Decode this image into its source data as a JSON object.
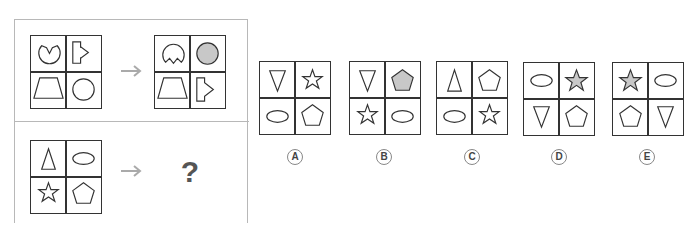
{
  "puzzle": {
    "example": {
      "before": [
        "pacman-open-top",
        "arrow-pentagon-right",
        "trapezoid",
        "circle"
      ],
      "after": [
        "pacman-open-bottom",
        "circle-filled",
        "trapezoid",
        "arrow-pentagon-right"
      ]
    },
    "question": {
      "grid": [
        "triangle-up",
        "ellipse",
        "star",
        "pentagon"
      ],
      "unknown_symbol": "?"
    },
    "arrow_icon": "right-arrow-icon"
  },
  "options": [
    {
      "label": "A",
      "cells": [
        "triangle-down",
        "star",
        "ellipse",
        "pentagon"
      ]
    },
    {
      "label": "B",
      "cells": [
        "triangle-down",
        "pentagon-filled",
        "star",
        "ellipse"
      ]
    },
    {
      "label": "C",
      "cells": [
        "triangle-up",
        "pentagon",
        "ellipse",
        "star"
      ]
    },
    {
      "label": "D",
      "cells": [
        "ellipse",
        "star-filled",
        "triangle-down",
        "pentagon"
      ]
    },
    {
      "label": "E",
      "cells": [
        "star-filled",
        "ellipse",
        "pentagon",
        "triangle-down"
      ]
    }
  ],
  "colors": {
    "stroke": "#333333",
    "fill_gray": "#c8c8c8",
    "frame": "#b8b8b8",
    "arrow": "#aaaaaa",
    "qmark": "#555555"
  }
}
